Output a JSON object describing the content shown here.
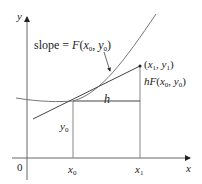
{
  "figure": {
    "axes": {
      "x_label": "x",
      "y_label": "y",
      "origin_label": "0"
    },
    "ticks": {
      "x0_label": "x",
      "x0_sub": "0",
      "x1_label": "x",
      "x1_sub": "1"
    },
    "annotations": {
      "slope_prefix": "slope = ",
      "slope_func": "F",
      "slope_args_open": "(",
      "slope_x": "x",
      "slope_x_sub": "0",
      "slope_comma": ", ",
      "slope_y": "y",
      "slope_y_sub": "0",
      "slope_args_close": ")",
      "point1_open": "(",
      "point1_x": "x",
      "point1_x_sub": "1",
      "point1_comma": ", ",
      "point1_y": "y",
      "point1_y_sub": "1",
      "point1_close": ")",
      "rise_h": "h",
      "rise_func": "F",
      "rise_open": "(",
      "rise_x": "x",
      "rise_x_sub": "0",
      "rise_comma": ", ",
      "rise_y": "y",
      "rise_y_sub": "0",
      "rise_close": ")",
      "run_label": "h",
      "y0_label": "y",
      "y0_sub": "0"
    },
    "colors": {
      "axis": "#555555",
      "curve": "#777777",
      "line": "#444444",
      "text": "#222222"
    }
  }
}
